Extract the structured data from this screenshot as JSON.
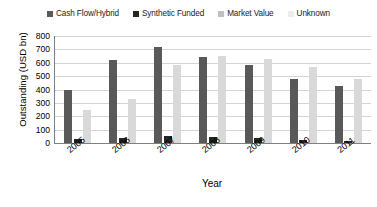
{
  "chart_data": {
    "type": "bar",
    "title": "",
    "xlabel": "Year",
    "ylabel": "Outstanding (USD bn)",
    "categories": [
      "2005",
      "2006",
      "2007",
      "2008",
      "2009",
      "2010",
      "2011"
    ],
    "ylim": [
      0,
      800
    ],
    "yticks": [
      800,
      700,
      600,
      500,
      400,
      300,
      200,
      100,
      0
    ],
    "grid": true,
    "legend_position": "top",
    "series": [
      {
        "name": "Cash Flow/Hybrid",
        "color": "#595959",
        "values": [
          400,
          620,
          720,
          640,
          580,
          480,
          430
        ]
      },
      {
        "name": "Synthetic Funded",
        "color": "#262626",
        "values": [
          30,
          40,
          50,
          45,
          35,
          20,
          15
        ]
      },
      {
        "name": "Market Value",
        "color": "#d9d9d9",
        "values": [
          250,
          330,
          580,
          650,
          630,
          570,
          480
        ]
      },
      {
        "name": "Unknown",
        "color": "#ededed",
        "values": [
          0,
          0,
          0,
          0,
          0,
          0,
          0
        ]
      }
    ]
  }
}
